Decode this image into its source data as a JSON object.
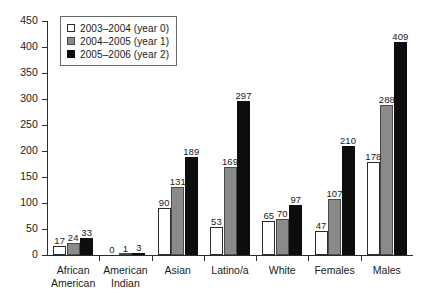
{
  "chart_data": {
    "type": "bar",
    "title": "",
    "subtitle": "",
    "xlabel": "",
    "ylabel": "",
    "ylim": [
      0,
      450
    ],
    "ytick_step": 50,
    "yticks": [
      0,
      50,
      100,
      150,
      200,
      250,
      300,
      350,
      400,
      450
    ],
    "ytick_labels": [
      "0",
      "50",
      "100",
      "150",
      "200",
      "250",
      "300",
      "350",
      "400",
      "450"
    ],
    "grid": false,
    "legend_position": "top-left",
    "categories": [
      "African American",
      "American Indian",
      "Asian",
      "Latino/a",
      "White",
      "Females",
      "Males"
    ],
    "category_lines": [
      [
        "African",
        "American"
      ],
      [
        "American",
        "Indian"
      ],
      [
        "Asian"
      ],
      [
        "Latino/a"
      ],
      [
        "White"
      ],
      [
        "Females"
      ],
      [
        "Males"
      ]
    ],
    "series": [
      {
        "name": "2003–2004 (year 0)",
        "color": "#ffffff",
        "values": [
          17,
          0,
          90,
          53,
          65,
          47,
          178
        ]
      },
      {
        "name": "2004–2005 (year 1)",
        "color": "#8a8a8a",
        "values": [
          24,
          1,
          131,
          169,
          70,
          107,
          288
        ]
      },
      {
        "name": "2005–2006 (year 2)",
        "color": "#0d0d0d",
        "values": [
          33,
          3,
          189,
          297,
          97,
          210,
          409
        ]
      }
    ]
  },
  "legend": {
    "items": [
      {
        "label": "2003–2004 (year 0)",
        "swatch": "white-square-icon"
      },
      {
        "label": "2004–2005 (year 1)",
        "swatch": "gray-square-icon"
      },
      {
        "label": "2005–2006 (year 2)",
        "swatch": "black-square-icon"
      }
    ]
  }
}
